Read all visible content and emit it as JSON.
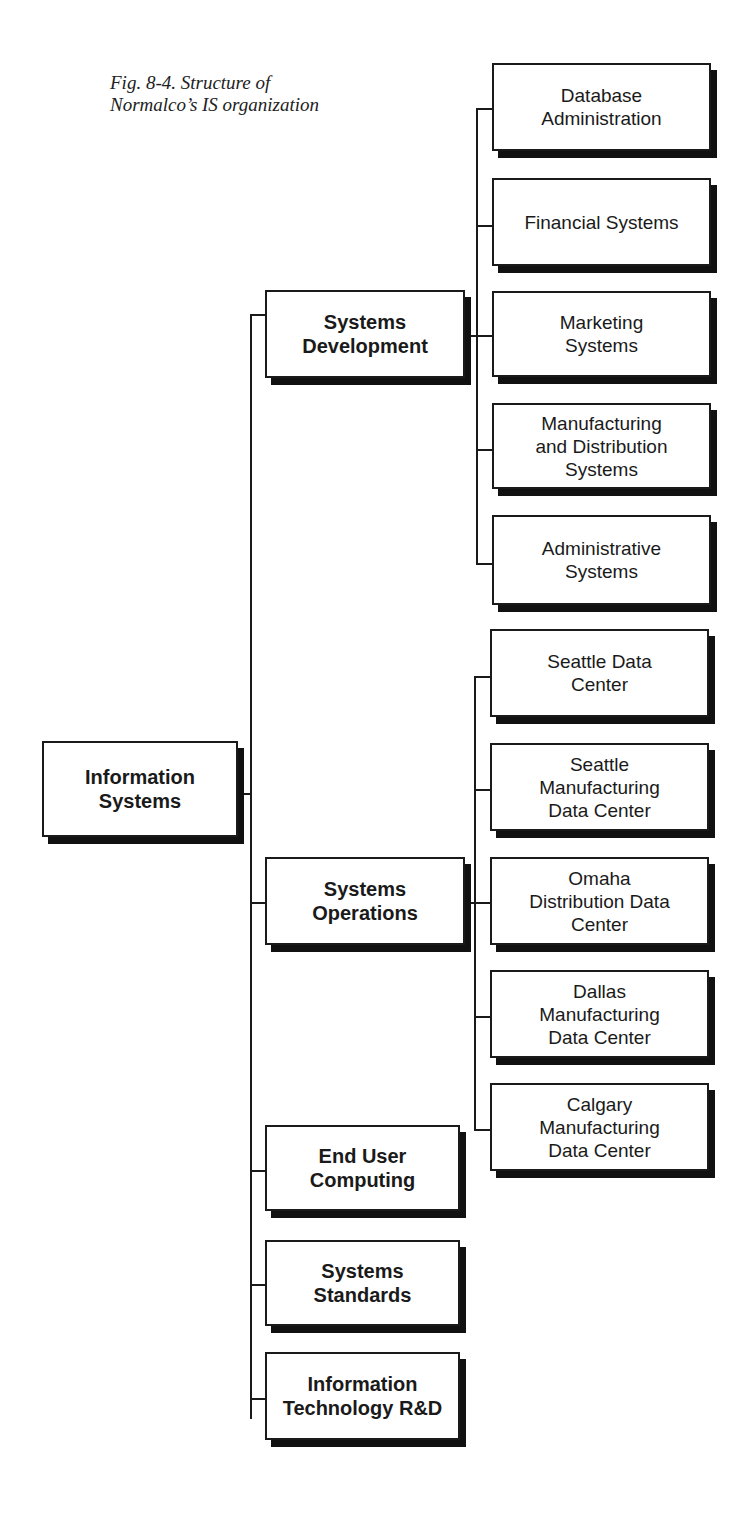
{
  "caption": {
    "line1": "Fig. 8-4. Structure of",
    "line2": "Normalco’s IS organization"
  },
  "root": {
    "lines": [
      "Information",
      "Systems"
    ]
  },
  "level1": [
    {
      "id": "systems-development",
      "lines": [
        "Systems",
        "Development"
      ]
    },
    {
      "id": "systems-operations",
      "lines": [
        "Systems",
        "Operations"
      ]
    },
    {
      "id": "end-user-computing",
      "lines": [
        "End User",
        "Computing"
      ]
    },
    {
      "id": "systems-standards",
      "lines": [
        "Systems",
        "Standards"
      ]
    },
    {
      "id": "it-rnd",
      "lines": [
        "Information",
        "Technology R&D"
      ]
    }
  ],
  "development_children": [
    {
      "id": "database-administration",
      "lines": [
        "Database",
        "Administration"
      ]
    },
    {
      "id": "financial-systems",
      "lines": [
        "Financial Systems"
      ]
    },
    {
      "id": "marketing-systems",
      "lines": [
        "Marketing",
        "Systems"
      ]
    },
    {
      "id": "manufacturing-distribution-systems",
      "lines": [
        "Manufacturing",
        "and Distribution",
        "Systems"
      ]
    },
    {
      "id": "administrative-systems",
      "lines": [
        "Administrative",
        "Systems"
      ]
    }
  ],
  "operations_children": [
    {
      "id": "seattle-data-center",
      "lines": [
        "Seattle Data",
        "Center"
      ]
    },
    {
      "id": "seattle-manufacturing-data-center",
      "lines": [
        "Seattle",
        "Manufacturing",
        "Data Center"
      ]
    },
    {
      "id": "omaha-distribution-data-center",
      "lines": [
        "Omaha",
        "Distribution Data",
        "Center"
      ]
    },
    {
      "id": "dallas-manufacturing-data-center",
      "lines": [
        "Dallas",
        "Manufacturing",
        "Data Center"
      ]
    },
    {
      "id": "calgary-manufacturing-data-center",
      "lines": [
        "Calgary",
        "Manufacturing",
        "Data Center"
      ]
    }
  ],
  "colors": {
    "line": "#1a1a1a",
    "shadow": "#111111",
    "box_fill": "#ffffff"
  }
}
